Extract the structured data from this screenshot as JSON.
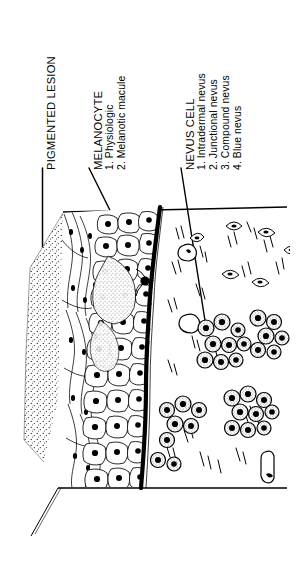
{
  "figure": {
    "type": "medical-illustration",
    "orientation": "labels rotated 90 degrees counter-clockwise",
    "ink_color": "#000000",
    "background_color": "#ffffff"
  },
  "labels": {
    "lesion": {
      "title": "PIGMENTED LESION"
    },
    "melanocyte": {
      "title": "MELANOCYTE",
      "items": [
        "1. Physiologic",
        "2. Melanotic macule"
      ]
    },
    "nevus": {
      "title": "NEVUS CELL",
      "items": [
        "1. Intradermal nevus",
        "2. Junctional nevus",
        "3. Compound nevus",
        "4. Blue nevus"
      ]
    }
  },
  "illustration": {
    "regions": [
      "skin-surface-stipple",
      "epidermis-keratinocytes",
      "dermo-epidermal-junction",
      "dermis-collagen",
      "melanocyte-dendritic-cell",
      "nevus-cell-nests",
      "dermal-fibroblasts"
    ]
  }
}
